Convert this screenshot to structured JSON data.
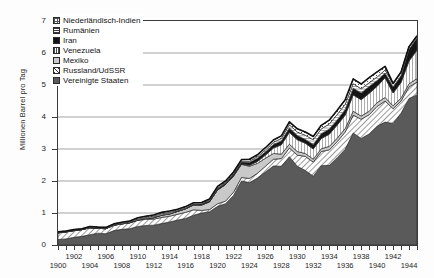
{
  "chart_data": {
    "type": "area",
    "stacked": true,
    "title": "",
    "xlabel": "",
    "ylabel": "Millionen Barrel pro Tag",
    "xlim": [
      1900,
      1945
    ],
    "ylim": [
      0,
      7
    ],
    "y_ticks": [
      0,
      1,
      2,
      3,
      4,
      5,
      6,
      7
    ],
    "grid": "horizontal",
    "legend_position": "top-left",
    "x_tick_interval": 1,
    "x_label_interval": 2,
    "x_tick_labels": [
      "1900",
      "1902",
      "1904",
      "1906",
      "1908",
      "1910",
      "1912",
      "1914",
      "1916",
      "1918",
      "1920",
      "1922",
      "1924",
      "1926",
      "1928",
      "1930",
      "1932",
      "1934",
      "1936",
      "1938",
      "1940",
      "1942",
      "1944"
    ],
    "x": [
      1900,
      1901,
      1902,
      1903,
      1904,
      1905,
      1906,
      1907,
      1908,
      1909,
      1910,
      1911,
      1912,
      1913,
      1914,
      1915,
      1916,
      1917,
      1918,
      1919,
      1920,
      1921,
      1922,
      1923,
      1924,
      1925,
      1926,
      1927,
      1928,
      1929,
      1930,
      1931,
      1932,
      1933,
      1934,
      1935,
      1936,
      1937,
      1938,
      1939,
      1940,
      1941,
      1942,
      1943,
      1944,
      1945
    ],
    "series": [
      {
        "name": "Vereinigte Staaten",
        "pattern": "solid-dark-gray",
        "color": "#5a5a5a",
        "values": [
          0.17,
          0.19,
          0.24,
          0.27,
          0.32,
          0.37,
          0.35,
          0.45,
          0.49,
          0.51,
          0.58,
          0.61,
          0.62,
          0.67,
          0.72,
          0.78,
          0.83,
          0.93,
          1.0,
          1.04,
          1.21,
          1.29,
          1.55,
          2.0,
          1.95,
          2.09,
          2.28,
          2.47,
          2.46,
          2.76,
          2.46,
          2.33,
          2.15,
          2.48,
          2.49,
          2.73,
          2.99,
          3.5,
          3.33,
          3.47,
          3.71,
          3.84,
          3.8,
          4.12,
          4.58,
          4.69
        ]
      },
      {
        "name": "Russland/UdSSR",
        "pattern": "diagonal-hatch",
        "color": "#ffffff",
        "values": [
          0.21,
          0.22,
          0.21,
          0.21,
          0.22,
          0.15,
          0.16,
          0.17,
          0.17,
          0.18,
          0.19,
          0.19,
          0.19,
          0.19,
          0.18,
          0.18,
          0.19,
          0.17,
          0.08,
          0.07,
          0.08,
          0.08,
          0.1,
          0.11,
          0.13,
          0.15,
          0.18,
          0.21,
          0.24,
          0.27,
          0.35,
          0.44,
          0.44,
          0.44,
          0.48,
          0.5,
          0.54,
          0.56,
          0.6,
          0.6,
          0.62,
          0.66,
          0.46,
          0.38,
          0.36,
          0.4
        ]
      },
      {
        "name": "Mexiko",
        "pattern": "light-gray",
        "color": "#c9c9c9",
        "values": [
          0.0,
          0.0,
          0.0,
          0.0,
          0.0,
          0.0,
          0.0,
          0.0,
          0.0,
          0.01,
          0.01,
          0.03,
          0.04,
          0.07,
          0.07,
          0.09,
          0.11,
          0.15,
          0.17,
          0.24,
          0.43,
          0.52,
          0.5,
          0.41,
          0.38,
          0.31,
          0.25,
          0.18,
          0.14,
          0.12,
          0.11,
          0.09,
          0.09,
          0.09,
          0.11,
          0.11,
          0.11,
          0.12,
          0.1,
          0.11,
          0.12,
          0.11,
          0.09,
          0.09,
          0.1,
          0.11
        ]
      },
      {
        "name": "Venezuela",
        "pattern": "vertical-lines",
        "color": "#ffffff",
        "values": [
          0.0,
          0.0,
          0.0,
          0.0,
          0.0,
          0.0,
          0.0,
          0.0,
          0.0,
          0.0,
          0.0,
          0.0,
          0.0,
          0.0,
          0.0,
          0.0,
          0.0,
          0.0,
          0.0,
          0.0,
          0.0,
          0.0,
          0.01,
          0.01,
          0.03,
          0.06,
          0.1,
          0.17,
          0.29,
          0.37,
          0.37,
          0.32,
          0.32,
          0.32,
          0.38,
          0.41,
          0.42,
          0.51,
          0.51,
          0.56,
          0.51,
          0.62,
          0.4,
          0.49,
          0.71,
          0.89
        ]
      },
      {
        "name": "Iran",
        "pattern": "solid-black",
        "color": "#141414",
        "values": [
          0.0,
          0.0,
          0.0,
          0.0,
          0.0,
          0.0,
          0.0,
          0.0,
          0.0,
          0.0,
          0.0,
          0.0,
          0.01,
          0.01,
          0.01,
          0.01,
          0.01,
          0.02,
          0.03,
          0.03,
          0.04,
          0.04,
          0.05,
          0.06,
          0.09,
          0.1,
          0.1,
          0.11,
          0.12,
          0.14,
          0.13,
          0.12,
          0.14,
          0.15,
          0.16,
          0.16,
          0.17,
          0.21,
          0.21,
          0.21,
          0.18,
          0.14,
          0.19,
          0.21,
          0.36,
          0.38
        ]
      },
      {
        "name": "Venezuela-upper-gap",
        "pattern": "white",
        "color": "#ffffff",
        "values": [
          0,
          0,
          0,
          0,
          0,
          0,
          0,
          0,
          0,
          0,
          0,
          0,
          0,
          0,
          0,
          0,
          0,
          0,
          0,
          0,
          0,
          0,
          0,
          0,
          0,
          0,
          0,
          0,
          0,
          0,
          0,
          0,
          0,
          0,
          0,
          0,
          0,
          0,
          0,
          0,
          0,
          0,
          0,
          0,
          0,
          0
        ],
        "hidden": true
      },
      {
        "name": "Rumänien",
        "pattern": "horizontal-lines",
        "color": "#ffffff",
        "values": [
          0.01,
          0.01,
          0.01,
          0.01,
          0.01,
          0.01,
          0.01,
          0.01,
          0.02,
          0.02,
          0.03,
          0.03,
          0.04,
          0.04,
          0.04,
          0.02,
          0.02,
          0.01,
          0.01,
          0.02,
          0.02,
          0.02,
          0.02,
          0.03,
          0.04,
          0.05,
          0.06,
          0.07,
          0.08,
          0.1,
          0.11,
          0.13,
          0.15,
          0.15,
          0.16,
          0.17,
          0.17,
          0.14,
          0.13,
          0.12,
          0.11,
          0.1,
          0.09,
          0.1,
          0.07,
          0.05
        ]
      },
      {
        "name": "Niederländisch-Indien",
        "pattern": "dotted-grid",
        "color": "#ffffff",
        "values": [
          0.02,
          0.02,
          0.02,
          0.02,
          0.03,
          0.03,
          0.03,
          0.03,
          0.03,
          0.03,
          0.04,
          0.04,
          0.04,
          0.04,
          0.04,
          0.04,
          0.04,
          0.04,
          0.04,
          0.04,
          0.05,
          0.05,
          0.05,
          0.05,
          0.06,
          0.06,
          0.07,
          0.07,
          0.08,
          0.09,
          0.1,
          0.1,
          0.1,
          0.11,
          0.12,
          0.13,
          0.14,
          0.15,
          0.15,
          0.16,
          0.16,
          0.11,
          0.02,
          0.02,
          0.02,
          0.02
        ]
      }
    ],
    "legend_entries": [
      {
        "label": "Niederländisch-Indien",
        "swatch": "sw-dots"
      },
      {
        "label": "Rumänien",
        "swatch": "sw-hlines"
      },
      {
        "label": "Iran",
        "swatch": "sw-black"
      },
      {
        "label": "Venezuela",
        "swatch": "sw-vlines"
      },
      {
        "label": "Mexiko",
        "swatch": "sw-lightgray"
      },
      {
        "label": "Russland/UdSSR",
        "swatch": "sw-diag"
      },
      {
        "label": "Vereinigte Staaten",
        "swatch": "sw-darkgray"
      }
    ]
  }
}
